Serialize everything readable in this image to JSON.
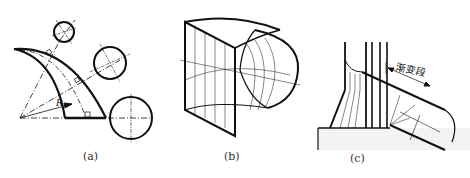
{
  "figure": {
    "panels": [
      {
        "id": "a",
        "caption": "(a)",
        "description": "Bend pipe section view with cross-section circles",
        "radius_label": "R"
      },
      {
        "id": "b",
        "caption": "(b)",
        "description": "Square-to-round transition bend, isometric"
      },
      {
        "id": "c",
        "caption": "(c)",
        "description": "Pipe outlet through wall with transition section",
        "annotation": "渐变段"
      }
    ]
  },
  "colors": {
    "line": "#111111",
    "background": "#ffffff",
    "hatch": "#555555"
  }
}
